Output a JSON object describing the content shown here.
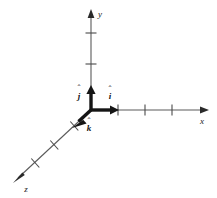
{
  "figure": {
    "background_color": "#ffffff",
    "axis_color": "#5a5a5a",
    "vector_color": "#1a1a1a",
    "label_color": "#1a1a1a",
    "origin": {
      "x": 91,
      "y": 110
    }
  },
  "axes": [
    {
      "name": "x-axis",
      "label": "x",
      "label_position": {
        "x": 205,
        "y": 122
      },
      "start": {
        "x": 91,
        "y": 110
      },
      "end": {
        "x": 209,
        "y": 110
      },
      "arrowhead": true,
      "tick_count": 3,
      "ticks": [
        {
          "index": 1,
          "x": 118,
          "y": 110
        },
        {
          "index": 2,
          "x": 145,
          "y": 110
        },
        {
          "index": 3,
          "x": 172,
          "y": 110
        }
      ]
    },
    {
      "name": "y-axis",
      "label": "y",
      "label_position": {
        "x": 98,
        "y": 16
      },
      "start": {
        "x": 91,
        "y": 110
      },
      "end": {
        "x": 91,
        "y": 9
      },
      "arrowhead": true,
      "tick_count": 2,
      "ticks": [
        {
          "index": 1,
          "x": 91,
          "y": 64
        },
        {
          "index": 2,
          "x": 91,
          "y": 33
        }
      ]
    },
    {
      "name": "z-axis",
      "label": "z",
      "label_position": {
        "x": 25,
        "y": 191
      },
      "start": {
        "x": 91,
        "y": 110
      },
      "end": {
        "x": 13,
        "y": 183
      },
      "arrowhead": true,
      "tick_count": 3,
      "ticks": [
        {
          "index": 1,
          "x": 74,
          "y": 126
        },
        {
          "index": 2,
          "x": 54,
          "y": 145
        },
        {
          "index": 3,
          "x": 35,
          "y": 163
        }
      ]
    }
  ],
  "unit_vectors": [
    {
      "name": "i-hat",
      "letter": "i",
      "hat": "̂",
      "along_axis": "x",
      "tail": {
        "x": 91,
        "y": 110
      },
      "tip": {
        "x": 118,
        "y": 110
      },
      "label_position": {
        "x": 110,
        "y": 97
      }
    },
    {
      "name": "j-hat",
      "letter": "j",
      "hat": "̂",
      "along_axis": "y",
      "tail": {
        "x": 91,
        "y": 110
      },
      "tip": {
        "x": 91,
        "y": 86
      },
      "label_position": {
        "x": 79,
        "y": 96
      }
    },
    {
      "name": "k-hat",
      "letter": "k",
      "hat": "̂",
      "along_axis": "z",
      "tail": {
        "x": 91,
        "y": 110
      },
      "tip": {
        "x": 73,
        "y": 127
      },
      "label_position": {
        "x": 89,
        "y": 129
      }
    }
  ]
}
